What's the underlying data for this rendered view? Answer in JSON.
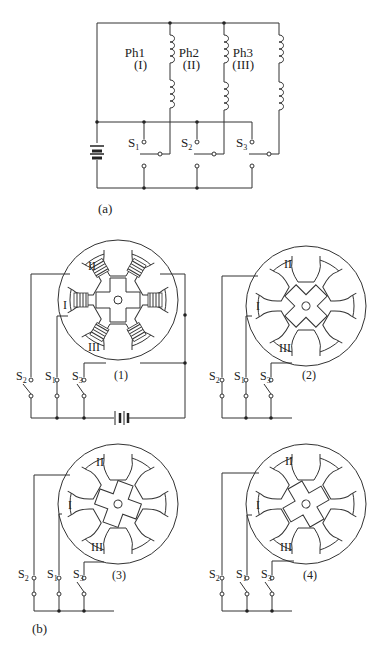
{
  "figure": {
    "panel_a": {
      "label": "(a)",
      "phases": [
        {
          "name": "Ph1",
          "roman": "(I)",
          "switch": "S",
          "switch_sub": "1"
        },
        {
          "name": "Ph2",
          "roman": "(II)",
          "switch": "S",
          "switch_sub": "2"
        },
        {
          "name": "Ph3",
          "roman": "(III)",
          "switch": "S",
          "switch_sub": "3"
        }
      ]
    },
    "panel_b": {
      "label": "(b)",
      "steps": [
        {
          "label": "(1)",
          "pole_labels": [
            "I",
            "II",
            "III"
          ],
          "switches": [
            {
              "s": "S",
              "sub": "2"
            },
            {
              "s": "S",
              "sub": "1"
            },
            {
              "s": "S",
              "sub": "3"
            }
          ]
        },
        {
          "label": "(2)",
          "pole_labels": [
            "I",
            "II",
            "III"
          ],
          "switches": [
            {
              "s": "S",
              "sub": "2"
            },
            {
              "s": "S",
              "sub": "1"
            },
            {
              "s": "S",
              "sub": "3"
            }
          ]
        },
        {
          "label": "(3)",
          "pole_labels": [
            "I",
            "II",
            "III"
          ],
          "switches": [
            {
              "s": "S",
              "sub": "2"
            },
            {
              "s": "S",
              "sub": "1"
            },
            {
              "s": "S",
              "sub": "3"
            }
          ]
        },
        {
          "label": "(4)",
          "pole_labels": [
            "I",
            "II",
            "III"
          ],
          "switches": [
            {
              "s": "S",
              "sub": "2"
            },
            {
              "s": "S",
              "sub": "1"
            },
            {
              "s": "S",
              "sub": "3"
            }
          ]
        }
      ]
    }
  }
}
